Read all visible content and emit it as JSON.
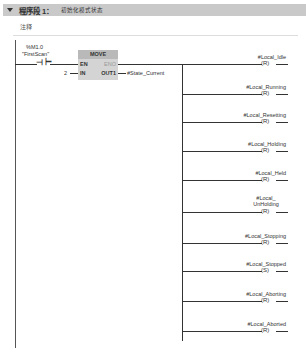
{
  "network": {
    "label": "程序段 1：",
    "title": "初始化模式状态",
    "comment": "注释"
  },
  "contact": {
    "address": "%M1.0",
    "tag": "\"FirstScan\""
  },
  "move_block": {
    "title": "MOVE",
    "en": "EN",
    "eno": "ENO",
    "in": "IN",
    "out": "OUT1",
    "in_value": "2",
    "out_value": "#State_Current"
  },
  "coils": [
    {
      "tag": "#Local_Idle",
      "type": "R"
    },
    {
      "tag": "#Local_Running",
      "type": "R"
    },
    {
      "tag": "#Local_Resetting",
      "type": "R"
    },
    {
      "tag": "#Local_Holding",
      "type": "R"
    },
    {
      "tag": "#Local_Held",
      "type": "R"
    },
    {
      "tag": "#Local_ UnHolding",
      "type": "R"
    },
    {
      "tag": "#Local_Stopping",
      "type": "R"
    },
    {
      "tag": "#Local_Stopped",
      "type": "S"
    },
    {
      "tag": "#Local_Aborting",
      "type": "R"
    },
    {
      "tag": "#Local_Aborted",
      "type": "R"
    }
  ]
}
